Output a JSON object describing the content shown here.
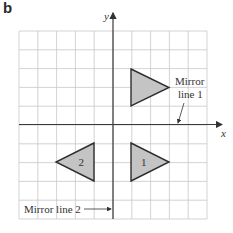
{
  "part_label": "b",
  "axes": {
    "x_label": "x",
    "y_label": "y"
  },
  "grid": {
    "columns": 10,
    "rows": 10,
    "left": 19,
    "top": 31,
    "cell": 18.8,
    "line_color": "#c8c8c8",
    "axis_color": "#3a3a3a"
  },
  "shapes": [
    {
      "name": "upper-triangle",
      "label": "",
      "points": "131,69 169,87.5 131,106"
    },
    {
      "name": "triangle-1",
      "label": "1",
      "points": "131,143 169,162 131,181"
    },
    {
      "name": "triangle-2",
      "label": "2",
      "points": "94,143 56,162 94,181"
    }
  ],
  "fill_color": "#c4c4c4",
  "annotations": {
    "mirror_line_1": {
      "line1": "Mirror",
      "line2": "line 1"
    },
    "mirror_line_2": "Mirror line 2"
  }
}
